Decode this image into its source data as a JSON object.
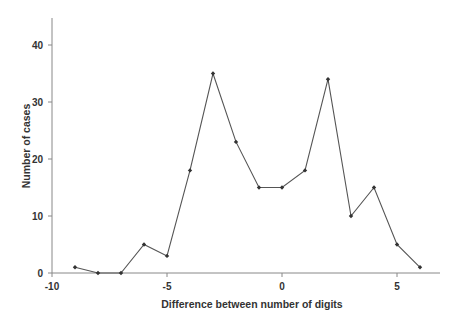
{
  "chart_data": {
    "type": "line",
    "title": "",
    "xlabel": "Difference between number of digits",
    "ylabel": "Number of cases",
    "x": [
      -9,
      -8,
      -7,
      -6,
      -5,
      -4,
      -3,
      -2,
      -1,
      0,
      1,
      2,
      3,
      4,
      5,
      6
    ],
    "series": [
      {
        "name": "cases",
        "values": [
          1,
          0,
          0,
          5,
          3,
          18,
          35,
          23,
          15,
          15,
          18,
          34,
          10,
          15,
          5,
          1
        ]
      }
    ],
    "xlim": [
      -10,
      7
    ],
    "ylim": [
      0,
      45
    ],
    "xticks": [
      -10,
      -5,
      0,
      5
    ],
    "yticks": [
      0,
      10,
      20,
      30,
      40
    ],
    "xtick_labels": [
      "-10",
      "-5",
      "0",
      "5"
    ],
    "ytick_labels": [
      "0",
      "10",
      "20",
      "30",
      "40"
    ],
    "grid": false,
    "legend": "none",
    "marker": "diamond",
    "line_color": "#555555"
  }
}
